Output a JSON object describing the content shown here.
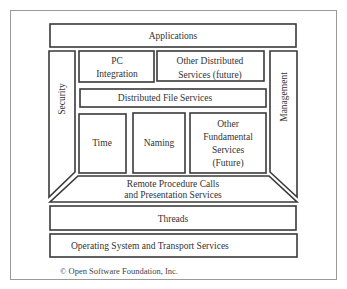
{
  "diagram": {
    "layers": {
      "applications": "Applications",
      "security": "Security",
      "management": "Management",
      "pc_integration": [
        "PC",
        "Integration"
      ],
      "other_distributed": [
        "Other Distributed",
        "Services (future)"
      ],
      "distributed_file_services": "Distributed File Services",
      "time": "Time",
      "naming": "Naming",
      "other_fundamental": [
        "Other",
        "Fundamental",
        "Services",
        "(Future)"
      ],
      "rpc": [
        "Remote Procedure Calls",
        "and Presentation Services"
      ],
      "threads": "Threads",
      "os_transport": "Operating System and Transport Services"
    },
    "copyright": "© Open Software Foundation, Inc."
  }
}
